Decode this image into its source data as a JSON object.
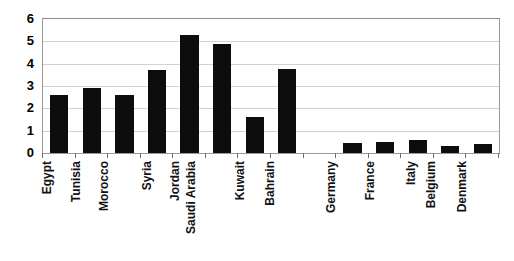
{
  "chart_data": {
    "type": "bar",
    "title": "",
    "xlabel": "",
    "ylabel": "",
    "ylim": [
      0,
      6
    ],
    "ytick_labels": [
      "0",
      "1",
      "2",
      "3",
      "4",
      "5",
      "6"
    ],
    "yticks": [
      0,
      1,
      2,
      3,
      4,
      5,
      6
    ],
    "grid": true,
    "legend": "none",
    "bar_color": "#0d0d0d",
    "gridline_color": "#d2d2d2",
    "axis_color": "#9a9a9a",
    "categories": [
      "Egypt",
      "Tunisia",
      "Morocco",
      "Syria",
      "Jordan",
      "Saudi Arabia",
      "Kuwait",
      "Bahrain",
      "",
      "Germany",
      "France",
      "Italy",
      "Belgium",
      "Denmark"
    ],
    "values": [
      2.6,
      2.9,
      2.6,
      3.7,
      5.3,
      4.9,
      1.6,
      3.75,
      null,
      0.45,
      0.5,
      0.6,
      0.3,
      0.4
    ]
  }
}
